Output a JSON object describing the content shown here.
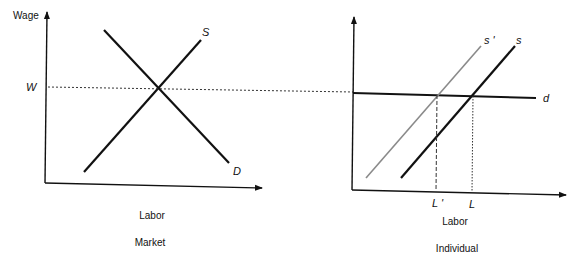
{
  "colors": {
    "ink": "#111111",
    "light_curve": "#8a8a8a",
    "background": "#ffffff"
  },
  "market_panel": {
    "y_axis_label": "Wage",
    "wage_marker": "W",
    "supply_label": "S",
    "demand_label": "D",
    "x_axis_label": "Labor",
    "caption": "Market"
  },
  "individual_panel": {
    "shifted_supply_label": "s '",
    "supply_label": "s",
    "demand_label": "d",
    "labor_shifted_label": "L '",
    "labor_label": "L",
    "x_axis_label": "Labor",
    "caption": "Individual"
  }
}
